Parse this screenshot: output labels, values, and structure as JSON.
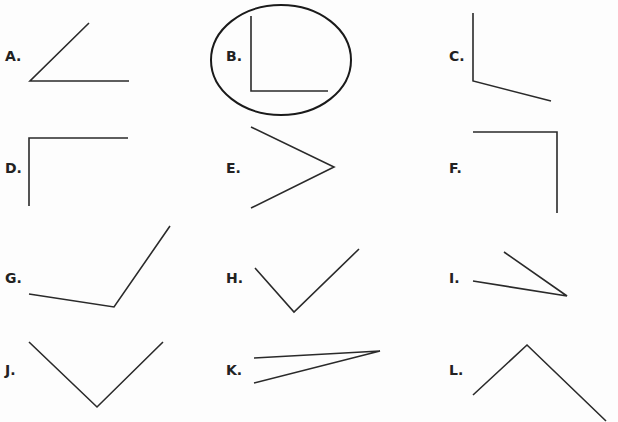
{
  "selected_option": "B",
  "options": [
    {
      "label": "A.",
      "x": 5,
      "y": 48,
      "points": "89,23 30,81 129,81"
    },
    {
      "label": "B.",
      "x": 226,
      "y": 48,
      "points": "251,16 251,91 328,91"
    },
    {
      "label": "C.",
      "x": 449,
      "y": 48,
      "points": "473,13 473,81 551,101"
    },
    {
      "label": "D.",
      "x": 5,
      "y": 160,
      "points": "29,206 29,138 128,138"
    },
    {
      "label": "E.",
      "x": 226,
      "y": 160,
      "points": "251,127 334,167 251,208"
    },
    {
      "label": "F.",
      "x": 449,
      "y": 160,
      "points": "473,132 557,132 557,213"
    },
    {
      "label": "G.",
      "x": 5,
      "y": 270,
      "points": "29,294 114,307 170,226"
    },
    {
      "label": "H.",
      "x": 226,
      "y": 270,
      "points": "255,268 294,312 359,249"
    },
    {
      "label": "I.",
      "x": 449,
      "y": 270,
      "points": "473,281 567,296 504,252"
    },
    {
      "label": "J.",
      "x": 5,
      "y": 362,
      "points": "29,342 97,407 163,342"
    },
    {
      "label": "K.",
      "x": 226,
      "y": 362,
      "points": "254,358 380,351 254,383"
    },
    {
      "label": "L.",
      "x": 449,
      "y": 362,
      "points": "473,395 527,345 606,421"
    }
  ],
  "selection_ellipse": {
    "cx": 281,
    "cy": 60,
    "rx": 70,
    "ry": 55
  },
  "colors": {
    "line": "#2a2a2a",
    "label": "#222222"
  }
}
